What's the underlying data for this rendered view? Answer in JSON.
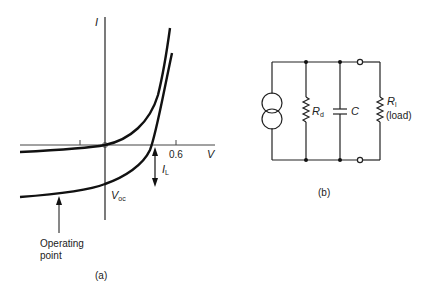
{
  "figure_a": {
    "caption": "(a)",
    "axis_labels": {
      "y": "I",
      "x": "V"
    },
    "tick_label": "0.6",
    "voc_label": {
      "main": "V",
      "sub": "oc"
    },
    "il_label": {
      "main": "I",
      "sub": "L"
    },
    "operating_point_label": {
      "line1": "Operating",
      "line2": "point"
    },
    "curves": [
      {
        "name": "dark",
        "description": "Diode I-V curve without illumination (passes through origin)"
      },
      {
        "name": "illuminated",
        "description": "I-V curve shifted down by I_L under illumination"
      }
    ]
  },
  "figure_b": {
    "caption": "(b)",
    "components": [
      {
        "type": "current-source",
        "label": ""
      },
      {
        "type": "resistor",
        "label": {
          "main": "R",
          "sub": "d"
        }
      },
      {
        "type": "capacitor",
        "label": "C"
      },
      {
        "type": "resistor",
        "label": {
          "main": "R",
          "sub": "l"
        },
        "note": "(load)"
      }
    ]
  },
  "colors": {
    "ink": "#111111",
    "background": "#ffffff"
  }
}
